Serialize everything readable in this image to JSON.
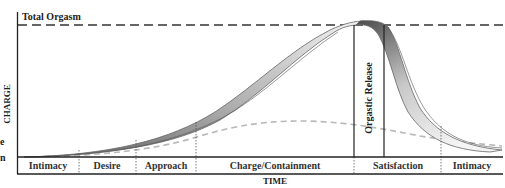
{
  "diagram": {
    "threshold_label": "Total Orgasm",
    "y_axis_label": "CHARGE",
    "x_axis_label": "TIME",
    "release_label": "Orgastic Release",
    "phases": [
      {
        "label": "Intimacy"
      },
      {
        "label": "Desire"
      },
      {
        "label": "Approach"
      },
      {
        "label": "Charge/Containment"
      },
      {
        "label": "Satisfaction"
      },
      {
        "label": "Intimacy"
      }
    ],
    "left_edge_fragments": [
      "e",
      "n"
    ],
    "colors": {
      "axis": "#222222",
      "threshold_dash": "#333333",
      "band_dark": "#6e6e6e",
      "band_light": "#efefef",
      "baseline_dash": "#b8b8b8",
      "divider": "#555555"
    }
  }
}
